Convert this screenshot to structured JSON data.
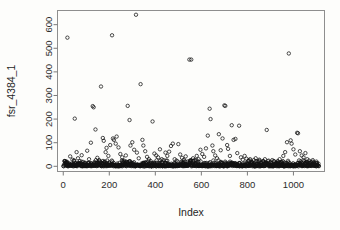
{
  "chart_data": {
    "type": "scatter",
    "title": "",
    "xlabel": "Index",
    "ylabel": "fsr_4384_1",
    "xlim": [
      -25,
      1135
    ],
    "ylim": [
      -22,
      660
    ],
    "grid": false,
    "legend": null,
    "marker": "open-circle",
    "marker_color": "#111111",
    "xticks": [
      0,
      200,
      400,
      600,
      800,
      1000
    ],
    "yticks": [
      0,
      100,
      200,
      300,
      400,
      500,
      600
    ],
    "xtick_labels": [
      "0",
      "200",
      "400",
      "600",
      "800",
      "1000"
    ],
    "ytick_labels": [
      "0",
      "100",
      "200",
      "300",
      "400",
      "500",
      "600"
    ],
    "n_points": 1110,
    "series": [
      {
        "name": "fsr_4384_1",
        "points": [
          [
            18,
            545
          ],
          [
            50,
            202
          ],
          [
            58,
            60
          ],
          [
            30,
            42
          ],
          [
            40,
            28
          ],
          [
            12,
            15
          ],
          [
            64,
            34
          ],
          [
            72,
            22
          ],
          [
            80,
            47
          ],
          [
            88,
            18
          ],
          [
            96,
            12
          ],
          [
            104,
            66
          ],
          [
            112,
            30
          ],
          [
            120,
            100
          ],
          [
            128,
            255
          ],
          [
            132,
            250
          ],
          [
            140,
            156
          ],
          [
            148,
            36
          ],
          [
            156,
            26
          ],
          [
            164,
            338
          ],
          [
            172,
            120
          ],
          [
            176,
            108
          ],
          [
            184,
            60
          ],
          [
            188,
            78
          ],
          [
            196,
            44
          ],
          [
            204,
            90
          ],
          [
            212,
            555
          ],
          [
            216,
            118
          ],
          [
            220,
            112
          ],
          [
            228,
            96
          ],
          [
            232,
            126
          ],
          [
            240,
            80
          ],
          [
            248,
            52
          ],
          [
            256,
            38
          ],
          [
            264,
            24
          ],
          [
            272,
            46
          ],
          [
            280,
            256
          ],
          [
            288,
            196
          ],
          [
            292,
            88
          ],
          [
            300,
            102
          ],
          [
            308,
            70
          ],
          [
            316,
            642
          ],
          [
            320,
            58
          ],
          [
            328,
            34
          ],
          [
            336,
            348
          ],
          [
            344,
            112
          ],
          [
            348,
            88
          ],
          [
            356,
            64
          ],
          [
            364,
            40
          ],
          [
            372,
            30
          ],
          [
            380,
            22
          ],
          [
            388,
            190
          ],
          [
            396,
            54
          ],
          [
            404,
            46
          ],
          [
            412,
            38
          ],
          [
            420,
            72
          ],
          [
            428,
            30
          ],
          [
            436,
            26
          ],
          [
            444,
            58
          ],
          [
            452,
            44
          ],
          [
            460,
            62
          ],
          [
            468,
            86
          ],
          [
            476,
            96
          ],
          [
            484,
            30
          ],
          [
            492,
            24
          ],
          [
            500,
            94
          ],
          [
            508,
            50
          ],
          [
            516,
            36
          ],
          [
            524,
            28
          ],
          [
            532,
            42
          ],
          [
            540,
            20
          ],
          [
            548,
            452
          ],
          [
            556,
            452
          ],
          [
            564,
            34
          ],
          [
            572,
            26
          ],
          [
            580,
            44
          ],
          [
            588,
            30
          ],
          [
            596,
            70
          ],
          [
            604,
            52
          ],
          [
            612,
            40
          ],
          [
            620,
            76
          ],
          [
            628,
            130
          ],
          [
            636,
            244
          ],
          [
            640,
            200
          ],
          [
            648,
            88
          ],
          [
            652,
            64
          ],
          [
            660,
            46
          ],
          [
            668,
            34
          ],
          [
            676,
            136
          ],
          [
            684,
            68
          ],
          [
            692,
            118
          ],
          [
            700,
            258
          ],
          [
            704,
            256
          ],
          [
            712,
            90
          ],
          [
            716,
            74
          ],
          [
            724,
            44
          ],
          [
            732,
            174
          ],
          [
            740,
            112
          ],
          [
            748,
            116
          ],
          [
            756,
            56
          ],
          [
            764,
            172
          ],
          [
            772,
            38
          ],
          [
            780,
            28
          ],
          [
            788,
            44
          ],
          [
            796,
            32
          ],
          [
            804,
            22
          ],
          [
            812,
            30
          ],
          [
            820,
            18
          ],
          [
            828,
            26
          ],
          [
            836,
            34
          ],
          [
            844,
            20
          ],
          [
            852,
            28
          ],
          [
            860,
            16
          ],
          [
            868,
            22
          ],
          [
            876,
            30
          ],
          [
            884,
            154
          ],
          [
            892,
            24
          ],
          [
            900,
            18
          ],
          [
            908,
            26
          ],
          [
            916,
            20
          ],
          [
            924,
            14
          ],
          [
            932,
            22
          ],
          [
            940,
            30
          ],
          [
            948,
            18
          ],
          [
            956,
            44
          ],
          [
            964,
            60
          ],
          [
            972,
            102
          ],
          [
            980,
            478
          ],
          [
            988,
            110
          ],
          [
            992,
            96
          ],
          [
            1000,
            72
          ],
          [
            1008,
            50
          ],
          [
            1016,
            142
          ],
          [
            1020,
            140
          ],
          [
            1028,
            64
          ],
          [
            1036,
            46
          ],
          [
            1044,
            38
          ],
          [
            1052,
            56
          ],
          [
            1060,
            30
          ],
          [
            1068,
            24
          ],
          [
            1076,
            18
          ],
          [
            1084,
            26
          ],
          [
            1092,
            14
          ],
          [
            1100,
            20
          ]
        ],
        "dense_band_description": "Approximately 960 additional observations form a near-continuous band between 0 and about 20 across the full index range."
      }
    ]
  },
  "axes": {
    "y_label": "fsr_4384_1",
    "x_label": "Index"
  }
}
